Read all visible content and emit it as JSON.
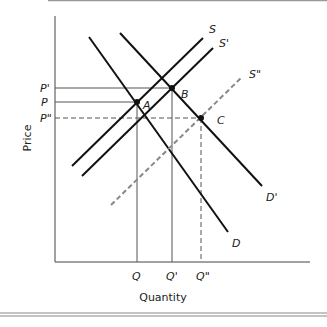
{
  "axes": {
    "x_label": "Quantity",
    "y_label": "Price"
  },
  "curves": {
    "S": "S",
    "S_prime": "S'",
    "S_double": "S\"",
    "D": "D",
    "D_prime": "D'"
  },
  "points": {
    "A": "A",
    "B": "B",
    "C": "C"
  },
  "price_ticks": {
    "P_prime": "P'",
    "P": "P",
    "P_double": "P\""
  },
  "quantity_ticks": {
    "Q": "Q",
    "Q_prime": "Q'",
    "Q_double": "Q\""
  },
  "colors": {
    "line": "#111111",
    "dashed": "#888888",
    "guide": "#555555"
  }
}
